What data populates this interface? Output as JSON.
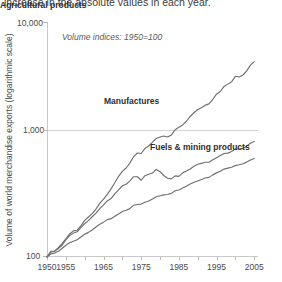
{
  "caption": {
    "text": "increase in the absolute values in each year."
  },
  "chart_data": {
    "type": "line",
    "title": "",
    "subtitle": "",
    "annotation": "Volume indices: 1950=100",
    "xlabel": "",
    "ylabel": "Volume of world merchandise exports (logarithmic scale)",
    "yscale": "log",
    "ylim": [
      100,
      10000
    ],
    "ytick_labels": [
      "100",
      "1,000",
      "10,000"
    ],
    "ytick_values": [
      100,
      1000,
      10000
    ],
    "xlim": [
      1950,
      2006
    ],
    "xtick_labels": [
      "1950",
      "1955",
      "1965",
      "1975",
      "1985",
      "1995",
      "2005"
    ],
    "xtick_values": [
      1950,
      1955,
      1965,
      1975,
      1985,
      1995,
      2005
    ],
    "minor_xticks": [
      1960,
      1970,
      1980,
      1990,
      2000
    ],
    "grid": "horizontal-at-1000",
    "legend": "inline-labels",
    "series": [
      {
        "name": "Manufactures",
        "label_position": "inside-upper",
        "x": [
          1950,
          1951,
          1952,
          1953,
          1954,
          1955,
          1956,
          1957,
          1958,
          1959,
          1960,
          1961,
          1962,
          1963,
          1964,
          1965,
          1966,
          1967,
          1968,
          1969,
          1970,
          1971,
          1972,
          1973,
          1974,
          1975,
          1976,
          1977,
          1978,
          1979,
          1980,
          1981,
          1982,
          1983,
          1984,
          1985,
          1986,
          1987,
          1988,
          1989,
          1990,
          1991,
          1992,
          1993,
          1994,
          1995,
          1996,
          1997,
          1998,
          1999,
          2000,
          2001,
          2002,
          2003,
          2004,
          2005
        ],
        "values": [
          100,
          112,
          112,
          120,
          130,
          143,
          157,
          167,
          169,
          184,
          205,
          219,
          234,
          256,
          286,
          311,
          341,
          380,
          428,
          486,
          536,
          572,
          630,
          716,
          768,
          760,
          840,
          880,
          950,
          1020,
          1050,
          1070,
          1050,
          1090,
          1210,
          1270,
          1330,
          1430,
          1570,
          1690,
          1800,
          1860,
          1960,
          2010,
          2200,
          2430,
          2560,
          2830,
          2960,
          3100,
          3450,
          3400,
          3540,
          3840,
          4300,
          4600
        ]
      },
      {
        "name": "Fuels & mining products",
        "label_position": "inside-middle",
        "x": [
          1950,
          1951,
          1952,
          1953,
          1954,
          1955,
          1956,
          1957,
          1958,
          1959,
          1960,
          1961,
          1962,
          1963,
          1964,
          1965,
          1966,
          1967,
          1968,
          1969,
          1970,
          1971,
          1972,
          1973,
          1974,
          1975,
          1976,
          1977,
          1978,
          1979,
          1980,
          1981,
          1982,
          1983,
          1984,
          1985,
          1986,
          1987,
          1988,
          1989,
          1990,
          1991,
          1992,
          1993,
          1994,
          1995,
          1996,
          1997,
          1998,
          1999,
          2000,
          2001,
          2002,
          2003,
          2004,
          2005
        ],
        "values": [
          100,
          110,
          112,
          118,
          126,
          140,
          152,
          160,
          164,
          178,
          192,
          204,
          220,
          236,
          258,
          278,
          300,
          314,
          344,
          372,
          404,
          416,
          444,
          482,
          482,
          450,
          492,
          506,
          518,
          556,
          532,
          494,
          468,
          462,
          490,
          486,
          520,
          540,
          562,
          592,
          616,
          626,
          640,
          640,
          672,
          700,
          730,
          760,
          766,
          790,
          830,
          830,
          840,
          880,
          930,
          960
        ]
      },
      {
        "name": "Agricultural products",
        "label_position": "inside-lower",
        "x": [
          1950,
          1951,
          1952,
          1953,
          1954,
          1955,
          1956,
          1957,
          1958,
          1959,
          1960,
          1961,
          1962,
          1963,
          1964,
          1965,
          1966,
          1967,
          1968,
          1969,
          1970,
          1971,
          1972,
          1973,
          1974,
          1975,
          1976,
          1977,
          1978,
          1979,
          1980,
          1981,
          1982,
          1983,
          1984,
          1985,
          1986,
          1987,
          1988,
          1989,
          1990,
          1991,
          1992,
          1993,
          1994,
          1995,
          1996,
          1997,
          1998,
          1999,
          2000,
          2001,
          2002,
          2003,
          2004,
          2005
        ],
        "values": [
          100,
          106,
          108,
          112,
          118,
          126,
          132,
          136,
          140,
          148,
          156,
          162,
          170,
          180,
          190,
          198,
          208,
          212,
          222,
          232,
          244,
          250,
          258,
          276,
          280,
          282,
          292,
          300,
          312,
          326,
          332,
          338,
          340,
          348,
          366,
          372,
          386,
          400,
          418,
          432,
          444,
          456,
          470,
          476,
          500,
          520,
          536,
          560,
          570,
          580,
          600,
          610,
          622,
          642,
          670,
          690
        ]
      }
    ],
    "colors": {
      "line": "#6f6f6f",
      "gridline": "#d2d2d2",
      "axis": "#c8c8c8",
      "text": "#4a4a4a",
      "label_text": "#2e2e2e",
      "background": "#ffffff"
    }
  }
}
